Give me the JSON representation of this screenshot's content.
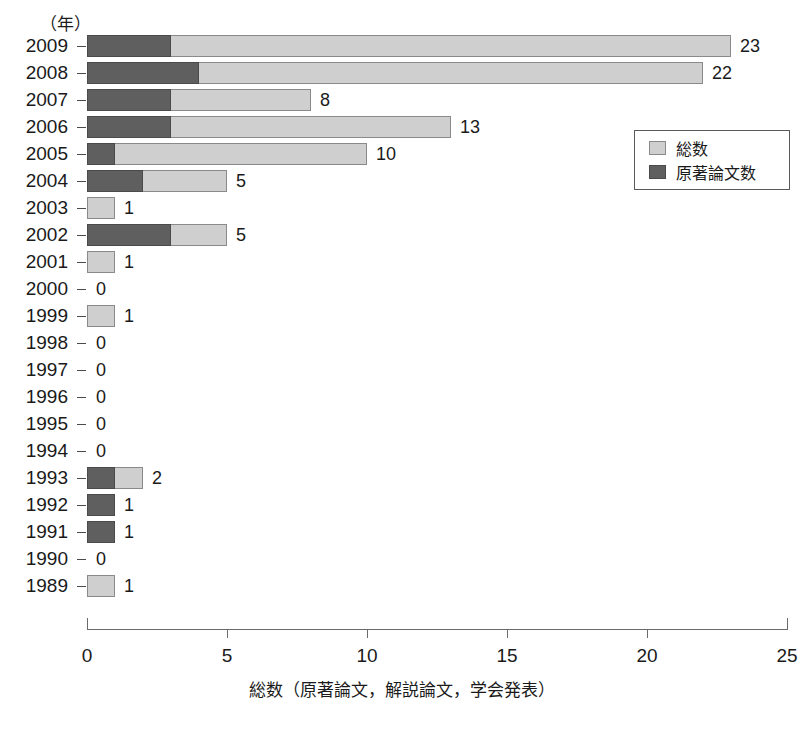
{
  "chart_data": {
    "type": "bar",
    "orientation": "horizontal",
    "stacked": true,
    "title": "",
    "xlabel": "総数（原著論文，解説論文，学会発表）",
    "ylabel": "（年）",
    "xlim": [
      0,
      25
    ],
    "xticks": [
      "0",
      "5",
      "10",
      "15",
      "20",
      "25"
    ],
    "grid": false,
    "legend_position": "right-top",
    "categories": [
      "2009",
      "2008",
      "2007",
      "2006",
      "2005",
      "2004",
      "2003",
      "2002",
      "2001",
      "2000",
      "1999",
      "1998",
      "1997",
      "1996",
      "1995",
      "1994",
      "1993",
      "1992",
      "1991",
      "1990",
      "1989"
    ],
    "series": [
      {
        "name": "原著論文数",
        "color": "#5f5f5f",
        "values": [
          3,
          4,
          3,
          3,
          1,
          2,
          0,
          3,
          0,
          0,
          0,
          0,
          0,
          0,
          0,
          0,
          1,
          1,
          1,
          0,
          0
        ]
      },
      {
        "name": "総数",
        "color": "#cfcfcf",
        "values": [
          23,
          22,
          8,
          13,
          10,
          5,
          1,
          5,
          1,
          0,
          1,
          0,
          0,
          0,
          0,
          0,
          2,
          1,
          1,
          0,
          1
        ]
      }
    ],
    "total_labels": [
      "23",
      "22",
      "8",
      "13",
      "10",
      "5",
      "1",
      "5",
      "1",
      "0",
      "1",
      "0",
      "0",
      "0",
      "0",
      "0",
      "2",
      "1",
      "1",
      "0",
      "1"
    ]
  },
  "legend": {
    "entries": [
      {
        "label": "総数",
        "swatch": "light-gray-swatch"
      },
      {
        "label": "原著論文数",
        "swatch": "dark-gray-swatch"
      }
    ]
  }
}
